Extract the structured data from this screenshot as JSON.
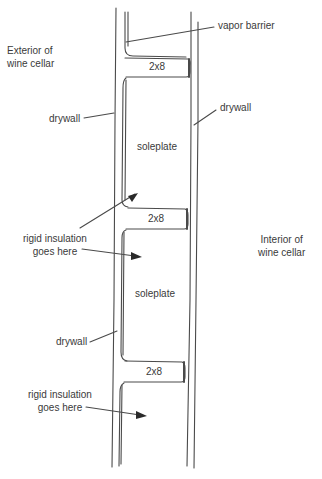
{
  "diagram": {
    "type": "wall-section-sketch",
    "stroke_color": "#4a4a4a",
    "text_color": "#3a3a3a"
  },
  "labels": {
    "exterior": [
      "Exterior of",
      "wine cellar"
    ],
    "interior": [
      "Interior of",
      "wine cellar"
    ],
    "vapor_barrier": "vapor barrier",
    "drywall_left_top": "drywall",
    "drywall_right": "drywall",
    "drywall_left_bottom": "drywall",
    "insulation_top": [
      "rigid insulation",
      "goes here"
    ],
    "insulation_bottom": [
      "rigid insulation",
      "goes here"
    ]
  },
  "boards": [
    {
      "label": "2x8",
      "type": "blocking"
    },
    {
      "label": "2x8",
      "type": "blocking"
    },
    {
      "label": "2x8",
      "type": "blocking"
    }
  ],
  "cavities": [
    {
      "label": "soleplate"
    },
    {
      "label": "soleplate"
    }
  ]
}
